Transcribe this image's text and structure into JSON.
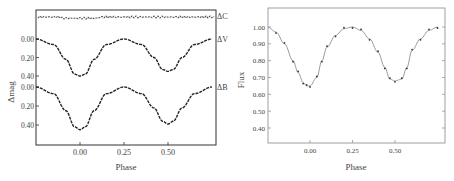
{
  "chart_data": [
    {
      "type": "scatter",
      "title": "",
      "xlabel": "Phase",
      "ylabel": "Δmag",
      "xticks": [
        "0.00",
        "0.25",
        "0.50"
      ],
      "xlim": [
        -0.25,
        0.75
      ],
      "legend_labels": [
        "ΔC",
        "ΔV",
        "ΔB"
      ],
      "grid": false,
      "series": [
        {
          "name": "ΔC",
          "x": [
            -0.25,
            0.0,
            0.25,
            0.5,
            0.75
          ],
          "values": [
            0.0,
            0.0,
            0.0,
            0.0,
            0.0
          ]
        },
        {
          "name": "ΔV",
          "yticks": [
            "0.00",
            "0.20",
            "0.40"
          ],
          "x": [
            -0.25,
            -0.15,
            -0.08,
            -0.03,
            0.0,
            0.03,
            0.08,
            0.15,
            0.25,
            0.35,
            0.42,
            0.47,
            0.5,
            0.53,
            0.58,
            0.65,
            0.75
          ],
          "values": [
            0.0,
            0.06,
            0.22,
            0.38,
            0.4,
            0.38,
            0.22,
            0.06,
            0.0,
            0.06,
            0.2,
            0.33,
            0.35,
            0.33,
            0.2,
            0.06,
            0.0
          ]
        },
        {
          "name": "ΔB",
          "yticks": [
            "0.00",
            "0.20",
            "0.40"
          ],
          "x": [
            -0.25,
            -0.15,
            -0.08,
            -0.03,
            0.0,
            0.03,
            0.08,
            0.15,
            0.25,
            0.35,
            0.42,
            0.47,
            0.5,
            0.53,
            0.58,
            0.65,
            0.75
          ],
          "values": [
            0.0,
            0.07,
            0.25,
            0.42,
            0.45,
            0.42,
            0.25,
            0.07,
            0.0,
            0.07,
            0.22,
            0.36,
            0.39,
            0.36,
            0.22,
            0.07,
            0.0
          ]
        }
      ]
    },
    {
      "type": "scatter",
      "title": "",
      "xlabel": "Phase",
      "ylabel": "Flux",
      "xticks": [
        "0.00",
        "0.25",
        "0.50"
      ],
      "yticks": [
        "1.00",
        "0.90",
        "0.80",
        "0.70",
        "0.60",
        "0.50",
        "0.40"
      ],
      "xlim": [
        -0.25,
        0.75
      ],
      "ylim": [
        0.3,
        1.1
      ],
      "grid": false,
      "series": [
        {
          "name": "Flux",
          "x": [
            -0.25,
            -0.2,
            -0.15,
            -0.1,
            -0.07,
            -0.04,
            -0.02,
            0.0,
            0.04,
            0.07,
            0.1,
            0.15,
            0.2,
            0.25,
            0.3,
            0.35,
            0.4,
            0.44,
            0.47,
            0.5,
            0.54,
            0.57,
            0.6,
            0.65,
            0.7,
            0.75
          ],
          "values": [
            1.0,
            0.97,
            0.9,
            0.8,
            0.73,
            0.67,
            0.65,
            0.65,
            0.7,
            0.8,
            0.88,
            0.95,
            0.99,
            1.0,
            0.98,
            0.93,
            0.85,
            0.76,
            0.69,
            0.68,
            0.69,
            0.76,
            0.86,
            0.93,
            0.98,
            1.0
          ]
        }
      ]
    }
  ]
}
